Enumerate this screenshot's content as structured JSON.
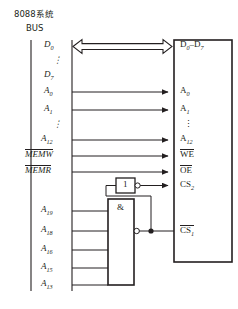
{
  "figure": {
    "title_cn": "8088系统",
    "title_en": "BUS",
    "ink_color": "#231f20",
    "background": "#ffffff"
  },
  "bus_left": {
    "name": "8088-system-bus",
    "signals": [
      {
        "id": "d0",
        "base": "D",
        "sub": "0",
        "overline": false,
        "text": "D0"
      },
      {
        "id": "ddots",
        "base": "⋮",
        "sub": "",
        "overline": false,
        "text": "⋮"
      },
      {
        "id": "d7",
        "base": "D",
        "sub": "7",
        "overline": false,
        "text": "D7"
      },
      {
        "id": "a0",
        "base": "A",
        "sub": "0",
        "overline": false,
        "text": "A0"
      },
      {
        "id": "a1",
        "base": "A",
        "sub": "1",
        "overline": false,
        "text": "A1"
      },
      {
        "id": "adots",
        "base": "⋮",
        "sub": "",
        "overline": false,
        "text": "⋮"
      },
      {
        "id": "a12",
        "base": "A",
        "sub": "12",
        "overline": false,
        "text": "A12"
      },
      {
        "id": "memw",
        "base": "MEMW",
        "sub": "",
        "overline": true,
        "text": "MEMW"
      },
      {
        "id": "memr",
        "base": "MEMR",
        "sub": "",
        "overline": true,
        "text": "MEMR"
      },
      {
        "id": "a19",
        "base": "A",
        "sub": "19",
        "overline": false,
        "text": "A19"
      },
      {
        "id": "a18",
        "base": "A",
        "sub": "18",
        "overline": false,
        "text": "A18"
      },
      {
        "id": "a16",
        "base": "A",
        "sub": "16",
        "overline": false,
        "text": "A16"
      },
      {
        "id": "a15",
        "base": "A",
        "sub": "15",
        "overline": false,
        "text": "A15"
      },
      {
        "id": "a13",
        "base": "A",
        "sub": "13",
        "overline": false,
        "text": "A13"
      }
    ]
  },
  "chip": {
    "name": "memory-chip",
    "pins": [
      {
        "id": "d0_d7",
        "label": "D0–D7",
        "overline": false
      },
      {
        "id": "a0",
        "label": "A0",
        "overline": false
      },
      {
        "id": "a1",
        "label": "A1",
        "overline": false
      },
      {
        "id": "dots",
        "label": "⋮",
        "overline": false
      },
      {
        "id": "a12",
        "label": "A12",
        "overline": false
      },
      {
        "id": "we",
        "label": "WE",
        "overline": true
      },
      {
        "id": "oe",
        "label": "OE",
        "overline": true
      },
      {
        "id": "cs2",
        "label": "CS2",
        "overline": false
      },
      {
        "id": "cs1",
        "label": "CS1",
        "overline": true
      }
    ]
  },
  "gates": [
    {
      "id": "inverter",
      "symbol": "1",
      "name": "inverter-gate",
      "inverted_output": true
    },
    {
      "id": "and",
      "symbol": "&",
      "name": "and-gate",
      "inverted_output": true
    }
  ],
  "subs": {
    "zero": "0",
    "one": "1",
    "seven": "7",
    "twelve": "12",
    "thirteen": "13",
    "fifteen": "15",
    "sixteen": "16",
    "eighteen": "18",
    "nineteen": "19",
    "two": "2"
  },
  "letters": {
    "D": "D",
    "A": "A",
    "dash": "–",
    "vdots": "⋮",
    "MEMW": "MEMW",
    "MEMR": "MEMR",
    "WE": "WE",
    "OE": "OE",
    "CS": "CS"
  }
}
